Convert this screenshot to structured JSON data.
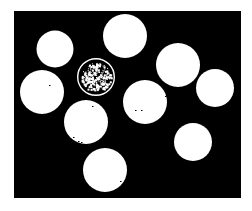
{
  "image": {
    "description": "Binary thresholded image of ten coins (white discs) on a black background; one coin rendered as a ring with speckled interior",
    "width": 252,
    "height": 211,
    "background_color": "#ffffff",
    "panel": {
      "x": 14,
      "y": 11,
      "width": 227,
      "height": 187,
      "color": "#000000"
    },
    "foreground_color": "#ffffff",
    "coins": [
      {
        "id": "coin-1",
        "cx": 55,
        "cy": 49,
        "r": 18.5,
        "style": "solid"
      },
      {
        "id": "coin-2",
        "cx": 125,
        "cy": 36,
        "r": 22,
        "style": "solid"
      },
      {
        "id": "coin-3",
        "cx": 96,
        "cy": 77,
        "r": 19,
        "style": "ring"
      },
      {
        "id": "coin-4",
        "cx": 178,
        "cy": 65,
        "r": 22,
        "style": "solid"
      },
      {
        "id": "coin-5",
        "cx": 215,
        "cy": 88,
        "r": 19,
        "style": "solid"
      },
      {
        "id": "coin-6",
        "cx": 42,
        "cy": 92,
        "r": 22,
        "style": "solid"
      },
      {
        "id": "coin-7",
        "cx": 145,
        "cy": 102,
        "r": 22,
        "style": "solid"
      },
      {
        "id": "coin-8",
        "cx": 86,
        "cy": 122,
        "r": 22,
        "style": "solid"
      },
      {
        "id": "coin-9",
        "cx": 193,
        "cy": 142,
        "r": 19,
        "style": "solid"
      },
      {
        "id": "coin-10",
        "cx": 105,
        "cy": 170,
        "r": 22,
        "style": "solid"
      }
    ],
    "specks": [
      {
        "x": 49,
        "y": 85
      },
      {
        "x": 92,
        "y": 106
      },
      {
        "x": 135,
        "y": 110
      },
      {
        "x": 141,
        "y": 110
      },
      {
        "x": 165,
        "y": 96
      },
      {
        "x": 73,
        "y": 137
      },
      {
        "x": 78,
        "y": 141
      },
      {
        "x": 81,
        "y": 142
      },
      {
        "x": 120,
        "y": 181
      }
    ]
  }
}
